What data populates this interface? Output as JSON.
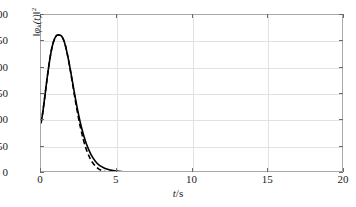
{
  "chart_data": {
    "type": "line",
    "title": "",
    "subtitle": "",
    "xlabel": "t/s",
    "xlabel_parts": {
      "italic": "t",
      "plain": "/s"
    },
    "ylabel": "‖φk(t)‖²",
    "ylabel_parts": {
      "norm_open": "‖",
      "symbol": "φ",
      "subscript": "k",
      "arg": "(t)",
      "norm_close": "‖",
      "superscript": "2"
    },
    "xlim": [
      0,
      20
    ],
    "ylim": [
      0,
      300
    ],
    "xticks": [
      0,
      5,
      10,
      15,
      20
    ],
    "xtick_labels": [
      "0",
      "5",
      "10",
      "15",
      "20"
    ],
    "yticks": [
      0,
      50,
      100,
      150,
      200,
      250,
      300
    ],
    "ytick_labels": [
      "0",
      "50",
      "100",
      "150",
      "200",
      "250",
      "300"
    ],
    "grid": true,
    "grid_color": "#e2e2e2",
    "frame_color": "#a9a9a9",
    "background": "#ffffff",
    "legend": null,
    "legend_position": "none",
    "series": [
      {
        "name": "solid",
        "style": "solid",
        "color": "#000000",
        "width": 1.6,
        "x": [
          0,
          0.1,
          0.2,
          0.3,
          0.4,
          0.5,
          0.6,
          0.7,
          0.8,
          0.9,
          1.0,
          1.1,
          1.2,
          1.3,
          1.35,
          1.4,
          1.5,
          1.6,
          1.7,
          1.8,
          1.9,
          2.0,
          2.2,
          2.4,
          2.6,
          2.8,
          3.0,
          3.2,
          3.4,
          3.6,
          3.8,
          4.0,
          4.2,
          4.4,
          4.6,
          4.8,
          5.0,
          5.3,
          5.6,
          6.0,
          6.5,
          7.0,
          7.5,
          8.0,
          9.0,
          10.0,
          12.0,
          14.0,
          16.0,
          18.0,
          20.0
        ],
        "y": [
          95,
          112,
          133,
          156,
          179,
          200,
          219,
          235,
          247,
          255,
          260,
          262,
          262,
          261,
          260,
          258,
          252,
          243,
          231,
          217,
          202,
          186,
          153,
          122,
          95,
          73,
          55,
          41,
          30,
          22,
          16,
          12,
          9,
          7,
          5.5,
          4.5,
          3.6,
          2.8,
          2.2,
          1.6,
          1.1,
          0.8,
          0.6,
          0.45,
          0.3,
          0.22,
          0.14,
          0.1,
          0.08,
          0.06,
          0.05
        ]
      },
      {
        "name": "dashed",
        "style": "dashed",
        "color": "#000000",
        "width": 1.6,
        "dash_pattern": "5,3",
        "x": [
          0,
          0.1,
          0.2,
          0.3,
          0.4,
          0.5,
          0.6,
          0.7,
          0.8,
          0.9,
          1.0,
          1.1,
          1.2,
          1.3,
          1.35,
          1.4,
          1.5,
          1.6,
          1.7,
          1.8,
          1.9,
          2.0,
          2.2,
          2.4,
          2.6,
          2.8,
          3.0,
          3.2,
          3.4,
          3.6,
          3.8,
          4.0,
          4.2,
          4.4,
          4.6,
          4.8,
          5.0,
          5.3,
          5.6,
          6.0,
          6.5,
          7.0,
          8.0,
          9.0,
          10.0,
          12.0,
          14.0,
          16.0,
          18.0,
          20.0
        ],
        "y": [
          95,
          112,
          133,
          156,
          179,
          200,
          219,
          235,
          247,
          255,
          260,
          262,
          262,
          261,
          260,
          258,
          252,
          243,
          231,
          217,
          201,
          184,
          149,
          116,
          87,
          63,
          44,
          30,
          20,
          13,
          8,
          5,
          3,
          1.8,
          1.1,
          0.7,
          0.45,
          0.3,
          0.2,
          0.14,
          0.1,
          0.08,
          0.06,
          0.05,
          0.04,
          0.03,
          0.03,
          0.02,
          0.02,
          0.02
        ]
      }
    ],
    "annotations": [],
    "peak": {
      "x": 1.2,
      "y": 262
    },
    "initial_value": 95
  }
}
